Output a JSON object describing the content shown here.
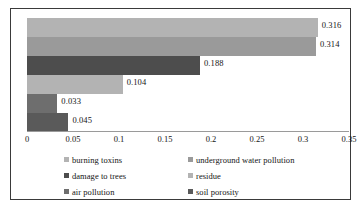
{
  "chart_data": {
    "type": "bar",
    "orientation": "horizontal",
    "title": "",
    "subtitle": "",
    "xlabel": "",
    "ylabel": "",
    "xlim": [
      0,
      0.35
    ],
    "x_ticks": [
      "0",
      "0.05",
      "0.1",
      "0.15",
      "0.2",
      "0.25",
      "0.3",
      "0.35"
    ],
    "x_tick_values": [
      0,
      0.05,
      0.1,
      0.15,
      0.2,
      0.25,
      0.3,
      0.35
    ],
    "grid": false,
    "legend_position": "bottom",
    "categories": [
      "burning toxins",
      "underground water pollution",
      "damage to trees",
      "residue",
      "air pollution",
      "soil porosity"
    ],
    "values": [
      0.316,
      0.314,
      0.188,
      0.104,
      0.033,
      0.045
    ],
    "data_labels": [
      "0.316",
      "0.314",
      "0.188",
      "0.104",
      "0.033",
      "0.045"
    ],
    "colors": [
      "#b3b3b3",
      "#9a9a9a",
      "#4d4d4d",
      "#b3b3b3",
      "#6e6e6e",
      "#5a5a5a"
    ],
    "bars": [
      {
        "category": "burning toxins",
        "value": 0.316,
        "label": "0.316",
        "color": "#b3b3b3"
      },
      {
        "category": "underground water pollution",
        "value": 0.314,
        "label": "0.314",
        "color": "#9a9a9a"
      },
      {
        "category": "damage to trees",
        "value": 0.188,
        "label": "0.188",
        "color": "#4d4d4d"
      },
      {
        "category": "residue",
        "value": 0.104,
        "label": "0.104",
        "color": "#b3b3b3"
      },
      {
        "category": "air pollution",
        "value": 0.033,
        "label": "0.033",
        "color": "#6e6e6e"
      },
      {
        "category": "soil porosity",
        "value": 0.045,
        "label": "0.045",
        "color": "#5a5a5a"
      }
    ]
  },
  "legend": {
    "items": [
      {
        "label": "burning toxins",
        "color": "#b3b3b3"
      },
      {
        "label": "underground water pollution",
        "color": "#9a9a9a"
      },
      {
        "label": "damage to trees",
        "color": "#4d4d4d"
      },
      {
        "label": "residue",
        "color": "#b3b3b3"
      },
      {
        "label": "air pollution",
        "color": "#6e6e6e"
      },
      {
        "label": "soil porosity",
        "color": "#5a5a5a"
      }
    ]
  },
  "style": {
    "frame_color": "#3a3a3a",
    "axis_color": "#9a9a9a",
    "text_color": "#141414",
    "background": "#ffffff"
  }
}
